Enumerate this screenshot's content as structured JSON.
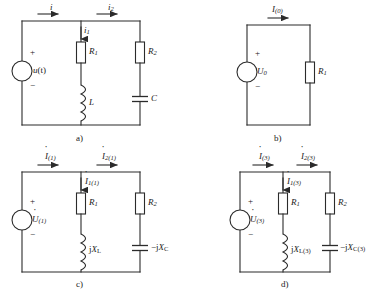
{
  "figure": {
    "kind": "circuit-diagram-set",
    "panel_count": 4,
    "line_color": "#2b2b2b",
    "background_color": "#ffffff"
  },
  "panels": {
    "a": {
      "caption": "a)",
      "source": {
        "label_main": "u",
        "label_arg": "(t)",
        "plus": "+",
        "minus": "−",
        "type": "ac-source-circle"
      },
      "currents": {
        "total": {
          "symbol": "i",
          "sub": "",
          "dot": false
        },
        "branch1": {
          "symbol": "i",
          "sub": "1",
          "dot": false
        },
        "branch2": {
          "symbol": "i",
          "sub": "2",
          "dot": false
        }
      },
      "components": [
        {
          "name": "resistor-r1",
          "symbol": "R",
          "sub": "1",
          "type": "resistor"
        },
        {
          "name": "resistor-r2",
          "symbol": "R",
          "sub": "2",
          "type": "resistor"
        },
        {
          "name": "inductor-l",
          "symbol": "L",
          "sub": "",
          "type": "inductor"
        },
        {
          "name": "capacitor-c",
          "symbol": "C",
          "sub": "",
          "type": "capacitor"
        }
      ]
    },
    "b": {
      "caption": "b)",
      "source": {
        "label_main": "U",
        "label_sub": "0",
        "plus": "+",
        "minus": "−",
        "type": "dc-source-circle"
      },
      "currents": {
        "total": {
          "symbol": "I",
          "sub": "(0)",
          "dot": false
        }
      },
      "components": [
        {
          "name": "resistor-r1",
          "symbol": "R",
          "sub": "1",
          "type": "resistor"
        }
      ]
    },
    "c": {
      "caption": "c)",
      "source": {
        "label_main": "U",
        "label_sub": "(1)",
        "plus": "+",
        "minus": "−",
        "dot": true,
        "type": "phasor-source-circle"
      },
      "currents": {
        "total": {
          "symbol": "I",
          "sub": "(1)",
          "dot": true
        },
        "branch1": {
          "symbol": "I",
          "sub": "1(1)",
          "dot": true
        },
        "branch2": {
          "symbol": "I",
          "sub": "2(1)",
          "dot": true
        }
      },
      "components": [
        {
          "name": "resistor-r1",
          "symbol": "R",
          "sub": "1",
          "type": "resistor"
        },
        {
          "name": "resistor-r2",
          "symbol": "R",
          "sub": "2",
          "type": "resistor"
        },
        {
          "name": "reactance-inductive",
          "prefix": "j",
          "symbol": "X",
          "sub": "L",
          "type": "inductor"
        },
        {
          "name": "reactance-capacitive",
          "prefix": "−j",
          "symbol": "X",
          "sub": "C",
          "type": "capacitor"
        }
      ]
    },
    "d": {
      "caption": "d)",
      "source": {
        "label_main": "U",
        "label_sub": "(3)",
        "plus": "+",
        "minus": "−",
        "dot": true,
        "type": "phasor-source-circle"
      },
      "currents": {
        "total": {
          "symbol": "I",
          "sub": "(3)",
          "dot": true
        },
        "branch1": {
          "symbol": "I",
          "sub": "1(3)",
          "dot": true
        },
        "branch2": {
          "symbol": "I",
          "sub": "2(3)",
          "dot": true
        }
      },
      "components": [
        {
          "name": "resistor-r1",
          "symbol": "R",
          "sub": "1",
          "type": "resistor"
        },
        {
          "name": "resistor-r2",
          "symbol": "R",
          "sub": "2",
          "type": "resistor"
        },
        {
          "name": "reactance-inductive",
          "prefix": "j",
          "symbol": "X",
          "sub": "L(3)",
          "type": "inductor"
        },
        {
          "name": "reactance-capacitive",
          "prefix": "−j",
          "symbol": "X",
          "sub": "C(3)",
          "type": "capacitor"
        }
      ]
    }
  },
  "labels": {
    "a_i": "i",
    "a_i1_sym": "i",
    "a_i1_sub": "1",
    "a_i2_sym": "i",
    "a_i2_sub": "2",
    "a_u": "u",
    "a_u_arg": "(t)",
    "a_R1_sym": "R",
    "a_R1_sub": "1",
    "a_R2_sym": "R",
    "a_R2_sub": "2",
    "a_L": "L",
    "a_C": "C",
    "a_plus": "+",
    "a_minus": "−",
    "a_caption": "a)",
    "b_I_sym": "I",
    "b_I_sub": "(0)",
    "b_U_sym": "U",
    "b_U_sub": "0",
    "b_R1_sym": "R",
    "b_R1_sub": "1",
    "b_plus": "+",
    "b_minus": "−",
    "b_caption": "b)",
    "c_I_sym": "I",
    "c_I_sub": "(1)",
    "c_I1_sym": "I",
    "c_I1_sub": "1(1)",
    "c_I2_sym": "I",
    "c_I2_sub": "2(1)",
    "c_U_sym": "U",
    "c_U_sub": "(1)",
    "c_R1_sym": "R",
    "c_R1_sub": "1",
    "c_R2_sym": "R",
    "c_R2_sub": "2",
    "c_XL_pre": "j",
    "c_XL_sym": "X",
    "c_XL_sub": "L",
    "c_XC_pre": "−j",
    "c_XC_sym": "X",
    "c_XC_sub": "C",
    "c_plus": "+",
    "c_minus": "−",
    "c_caption": "c)",
    "d_I_sym": "I",
    "d_I_sub": "(3)",
    "d_I1_sym": "I",
    "d_I1_sub": "1(3)",
    "d_I2_sym": "I",
    "d_I2_sub": "2(3)",
    "d_U_sym": "U",
    "d_U_sub": "(3)",
    "d_R1_sym": "R",
    "d_R1_sub": "1",
    "d_R2_sym": "R",
    "d_R2_sub": "2",
    "d_XL_pre": "j",
    "d_XL_sym": "X",
    "d_XL_sub": "L(3)",
    "d_XC_pre": "−j",
    "d_XC_sym": "X",
    "d_XC_sub": "C(3)",
    "d_plus": "+",
    "d_minus": "−",
    "d_caption": "d)"
  }
}
